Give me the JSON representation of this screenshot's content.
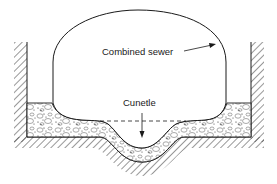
{
  "diagram": {
    "labels": {
      "combined_sewer": "Combined sewer",
      "cunette": "Cunetle"
    },
    "components": [
      {
        "id": "combined-sewer",
        "type": "dome-shaped pipe cross-section"
      },
      {
        "id": "cunette",
        "type": "low-flow channel depression"
      },
      {
        "id": "bedding",
        "type": "gravel/concrete bedding fill"
      },
      {
        "id": "trench-walls",
        "type": "hatched earth walls"
      },
      {
        "id": "trench-floor",
        "type": "hatched earth floor"
      },
      {
        "id": "dashed-line",
        "type": "reference invert line"
      }
    ],
    "colors": {
      "stroke": "#1a1a1a",
      "background": "#ffffff"
    }
  }
}
